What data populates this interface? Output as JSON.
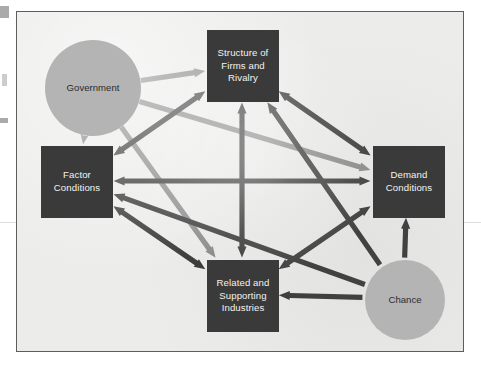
{
  "figure": {
    "background_color": "#ececeb",
    "border_color": "#5d5d5d",
    "box_color": "#3a3a3a",
    "box_text_color": "#f2f2f2",
    "circle_color": "#b4b4b4",
    "circle_text_color": "#2c2c2c",
    "arrow_dark_color": "#3a3a3a",
    "arrow_gray_color": "#8a8a8a"
  },
  "nodes": [
    {
      "id": "government",
      "label": "Government",
      "shape": "circle",
      "x": 28,
      "y": 28,
      "w": 96,
      "h": 96
    },
    {
      "id": "structure",
      "label": "Structure of Firms and Rivalry",
      "shape": "box",
      "x": 190,
      "y": 18,
      "w": 72,
      "h": 72
    },
    {
      "id": "factor",
      "label": "Factor Conditions",
      "shape": "box",
      "x": 24,
      "y": 134,
      "w": 72,
      "h": 72
    },
    {
      "id": "demand",
      "label": "Demand Conditions",
      "shape": "box",
      "x": 356,
      "y": 134,
      "w": 72,
      "h": 72
    },
    {
      "id": "related",
      "label": "Related and Supporting Industries",
      "shape": "box",
      "x": 190,
      "y": 248,
      "w": 72,
      "h": 72
    },
    {
      "id": "chance",
      "label": "Chance",
      "shape": "circle",
      "x": 348,
      "y": 248,
      "w": 80,
      "h": 80
    }
  ],
  "edges": [
    {
      "from": "government",
      "to": "structure",
      "style": "gray",
      "heads": "single"
    },
    {
      "from": "government",
      "to": "factor",
      "style": "gray",
      "heads": "single"
    },
    {
      "from": "government",
      "to": "demand",
      "style": "gray",
      "heads": "single"
    },
    {
      "from": "government",
      "to": "related",
      "style": "gray",
      "heads": "single"
    },
    {
      "from": "chance",
      "to": "related",
      "style": "dark",
      "heads": "single"
    },
    {
      "from": "chance",
      "to": "demand",
      "style": "dark",
      "heads": "single"
    },
    {
      "from": "chance",
      "to": "structure",
      "style": "dark",
      "heads": "single"
    },
    {
      "from": "chance",
      "to": "factor",
      "style": "dark",
      "heads": "single"
    },
    {
      "from": "structure",
      "to": "related",
      "style": "dark",
      "heads": "double"
    },
    {
      "from": "factor",
      "to": "demand",
      "style": "dark",
      "heads": "double"
    },
    {
      "from": "structure",
      "to": "factor",
      "style": "dark",
      "heads": "double"
    },
    {
      "from": "structure",
      "to": "demand",
      "style": "dark",
      "heads": "double"
    },
    {
      "from": "factor",
      "to": "related",
      "style": "dark",
      "heads": "double"
    },
    {
      "from": "demand",
      "to": "related",
      "style": "dark",
      "heads": "double"
    }
  ]
}
